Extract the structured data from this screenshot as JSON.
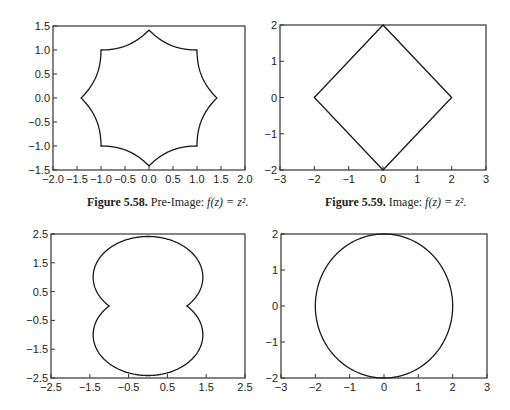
{
  "chart_data": [
    {
      "id": "fig-5-58",
      "type": "line",
      "title": "",
      "caption_label": "Figure 5.58.",
      "caption_text": "Pre-Image: ",
      "caption_formula": "f(z) = z².",
      "xlabel": "",
      "ylabel": "",
      "xlim": [
        -2.0,
        2.0
      ],
      "ylim": [
        -1.5,
        1.5
      ],
      "xticks": [
        "−2.0",
        "−1.5",
        "−1.0",
        "−0.5",
        "0.0",
        "0.5",
        "1.0",
        "1.5",
        "2.0"
      ],
      "xtick_values": [
        -2.0,
        -1.5,
        -1.0,
        -0.5,
        0.0,
        0.5,
        1.0,
        1.5,
        2.0
      ],
      "yticks": [
        "1.5",
        "1.0",
        "0.5",
        "0.0",
        "−0.5",
        "−1.0",
        "−1.5"
      ],
      "ytick_values": [
        1.5,
        1.0,
        0.5,
        0.0,
        -0.5,
        -1.0,
        -1.5
      ],
      "grid": false,
      "curve": "preimage-of-diamond |x²−y²| + |2xy| = 2",
      "key_points": [
        [
          1.414,
          0
        ],
        [
          1,
          1
        ],
        [
          0,
          1.414
        ],
        [
          -1,
          1
        ],
        [
          -1.414,
          0
        ],
        [
          -1,
          -1
        ],
        [
          0,
          -1.414
        ],
        [
          1,
          -1
        ]
      ],
      "frame_px": {
        "left": 53,
        "top": 26,
        "right": 245,
        "bottom": 170
      }
    },
    {
      "id": "fig-5-59",
      "type": "line",
      "title": "",
      "caption_label": "Figure 5.59.",
      "caption_text": "Image: ",
      "caption_formula": "f(z) = z².",
      "xlabel": "",
      "ylabel": "",
      "xlim": [
        -3,
        3
      ],
      "ylim": [
        -2,
        2
      ],
      "xticks": [
        "−3",
        "−2",
        "−1",
        "0",
        "1",
        "2",
        "3"
      ],
      "xtick_values": [
        -3,
        -2,
        -1,
        0,
        1,
        2,
        3
      ],
      "yticks": [
        "2",
        "1",
        "0",
        "−1",
        "−2"
      ],
      "ytick_values": [
        2,
        1,
        0,
        -1,
        -2
      ],
      "grid": false,
      "curve": "diamond |u| + |v| = 2",
      "key_points": [
        [
          2,
          0
        ],
        [
          0,
          2
        ],
        [
          -2,
          0
        ],
        [
          0,
          -2
        ]
      ],
      "frame_px": {
        "left": 280,
        "top": 25,
        "right": 486,
        "bottom": 170
      }
    },
    {
      "id": "fig-5-60",
      "type": "line",
      "title": "",
      "xlabel": "",
      "ylabel": "",
      "xlim": [
        -2.5,
        2.5
      ],
      "ylim": [
        -2.5,
        2.5
      ],
      "xticks": [
        "−2.5",
        "−1.5",
        "−0.5",
        "0.5",
        "1.5",
        "2.5"
      ],
      "xtick_values": [
        -2.5,
        -1.5,
        -0.5,
        0.5,
        1.5,
        2.5
      ],
      "yticks": [
        "2.5",
        "1.5",
        "0.5",
        "−0.5",
        "−1.5",
        "−2.5"
      ],
      "ytick_values": [
        2.5,
        1.5,
        0.5,
        -0.5,
        -1.5,
        -2.5
      ],
      "grid": false,
      "curve": "peanut-shaped closed curve with inward cusps near (±1, 0)",
      "key_points": [
        [
          0,
          2.4
        ],
        [
          1.4,
          1.0
        ],
        [
          1.0,
          0.0
        ],
        [
          1.4,
          -1.0
        ],
        [
          0,
          -2.4
        ],
        [
          -1.4,
          -1.0
        ],
        [
          -1.0,
          0.0
        ],
        [
          -1.4,
          1.0
        ]
      ],
      "frame_px": {
        "left": 51,
        "top": 234,
        "right": 245,
        "bottom": 378
      }
    },
    {
      "id": "fig-5-61",
      "type": "line",
      "title": "",
      "xlabel": "",
      "ylabel": "",
      "xlim": [
        -3,
        3
      ],
      "ylim": [
        -2,
        2
      ],
      "xticks": [
        "−3",
        "−2",
        "−1",
        "0",
        "1",
        "2",
        "3"
      ],
      "xtick_values": [
        -3,
        -2,
        -1,
        0,
        1,
        2,
        3
      ],
      "yticks": [
        "2",
        "1",
        "0",
        "−1",
        "−2"
      ],
      "ytick_values": [
        2,
        1,
        0,
        -1,
        -2
      ],
      "grid": false,
      "curve": "circle radius 2 centered at origin",
      "key_points": [
        [
          2,
          0
        ],
        [
          0,
          2
        ],
        [
          -2,
          0
        ],
        [
          0,
          -2
        ]
      ],
      "frame_px": {
        "left": 281,
        "top": 234,
        "right": 487,
        "bottom": 378
      }
    }
  ],
  "colors": {
    "line": "#1a1a1a",
    "frame": "#333333",
    "text": "#222222",
    "background": "#ffffff"
  }
}
